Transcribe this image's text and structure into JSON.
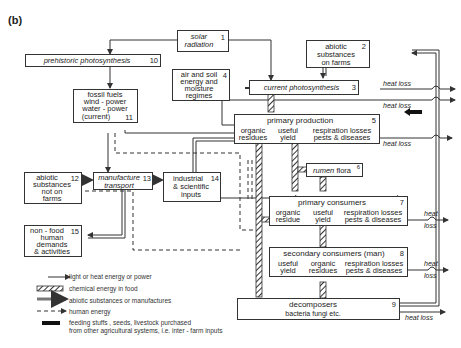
{
  "figure_label": "(b)",
  "nodes": {
    "n1": {
      "label_1": "solar",
      "label_2": "radiation",
      "num": "1"
    },
    "n2": {
      "label_1": "abiotic",
      "label_2": "substances",
      "label_3": "on farms",
      "num": "2"
    },
    "n3": {
      "label": "current photosynthesis",
      "num": "3"
    },
    "n4": {
      "label_1": "air and soil",
      "label_2": "energy and",
      "label_3": "moisture",
      "label_4": "regimes",
      "num": "4"
    },
    "n5": {
      "title": "primary production",
      "num": "5",
      "col1_1": "organic",
      "col1_2": "residues",
      "col2_1": "useful",
      "col2_2": "yield",
      "col3_1": "respiration losses",
      "col3_2": "pests & diseases"
    },
    "n6": {
      "label_it": "rumen",
      "label": "flora",
      "num": "6"
    },
    "n7": {
      "title": "primary consumers",
      "num": "7",
      "col1_1": "organic",
      "col1_2": "residue",
      "col2_1": "useful",
      "col2_2": "yield",
      "col3_1": "respiration losses",
      "col3_2": "pests & diseases"
    },
    "n8": {
      "title": "secondary consumers (man)",
      "num": "8",
      "col1_1": "useful",
      "col1_2": "yield",
      "col2_1": "organic",
      "col2_2": "residues",
      "col3_1": "respiration losses",
      "col3_2": "pests & diseases"
    },
    "n9": {
      "title": "decomposers",
      "sub": "bacteria fungi etc.",
      "num": "9"
    },
    "n10": {
      "label": "prehistoric photosynthesis",
      "num": "10"
    },
    "n11": {
      "label_1": "fossil fuels",
      "label_2": "wind - power",
      "label_3": "water - power",
      "label_4": "(current)",
      "num": "11"
    },
    "n12": {
      "label_1": "abiotic",
      "label_2": "substances",
      "label_3": "not on",
      "label_4": "farms",
      "num": "12"
    },
    "n13": {
      "label_1": "manufacture",
      "label_2": "transport",
      "num": "13"
    },
    "n14": {
      "label_1": "industrial",
      "label_2": "& scientific",
      "label_3": "inputs",
      "num": "14"
    },
    "n15": {
      "label_1": "non - food",
      "label_2": "human",
      "label_3": "demands",
      "label_4": "& activities",
      "num": "15"
    }
  },
  "heat_loss": {
    "label": "heat loss",
    "heat": "heat",
    "loss": "loss"
  },
  "legend": {
    "items": [
      {
        "symbol": "thin-arrow",
        "label": "light or heat energy or power"
      },
      {
        "symbol": "hatched-arrow",
        "label": "chemical energy in food"
      },
      {
        "symbol": "double-arrow",
        "label": "abiotic substances or manufactures"
      },
      {
        "symbol": "dashed-arrow",
        "label": "human energy"
      },
      {
        "symbol": "black-arrow",
        "label_1": "feeding stuffs , seeds, livestock purchased",
        "label_2": "from other agricultural systems, i.e. inter - farm inputs"
      }
    ]
  }
}
